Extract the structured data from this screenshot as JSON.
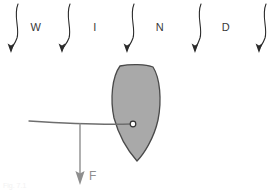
{
  "figure": {
    "canvas": {
      "width": 269,
      "height": 191,
      "background": "#ffffff"
    },
    "caption": "Fig. 7.1"
  },
  "wind": {
    "label_text": "WIND",
    "letters": [
      {
        "char": "W",
        "x": 36,
        "y": 31
      },
      {
        "char": "I",
        "x": 95,
        "y": 31
      },
      {
        "char": "N",
        "x": 160,
        "y": 31
      },
      {
        "char": "D",
        "x": 226,
        "y": 31
      }
    ],
    "arrow_color": "#2b2b2b",
    "arrow_count": 5,
    "arrows": [
      {
        "x_top": 18,
        "y_top": 4,
        "x_tip": 11,
        "y_tip": 52
      },
      {
        "x_top": 70,
        "y_top": 4,
        "x_tip": 62,
        "y_tip": 52
      },
      {
        "x_top": 134,
        "y_top": 4,
        "x_tip": 127,
        "y_tip": 52
      },
      {
        "x_top": 201,
        "y_top": 4,
        "x_tip": 195,
        "y_tip": 52
      },
      {
        "x_top": 266,
        "y_top": 4,
        "x_tip": 259,
        "y_tip": 52
      }
    ]
  },
  "vane": {
    "name": "vane-blade",
    "fill_color": "#a9a9a9",
    "stroke_color": "#4a4a4a",
    "top_y": 65,
    "bottom_y": 161,
    "left_x": 112,
    "right_x": 161
  },
  "pivot": {
    "name": "pivot-point",
    "x": 133,
    "y": 124,
    "radius": 3,
    "fill_color": "#ffffff",
    "stroke_color": "#333333"
  },
  "arm": {
    "name": "support-arm",
    "color": "#6e6e6e",
    "start_x": 29,
    "start_y": 122,
    "end_x": 133,
    "end_y": 124
  },
  "force": {
    "label": "F",
    "label_x": 89,
    "label_y": 180,
    "color": "#8e8e8e",
    "arrow_x": 80,
    "arrow_y_start": 126,
    "arrow_y_tip": 184
  }
}
